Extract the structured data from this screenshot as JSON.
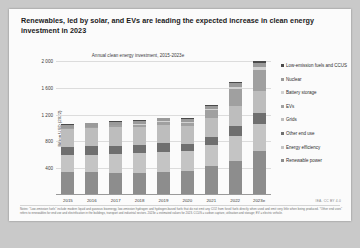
{
  "slide": {
    "title": "Renewables, led by solar, and EVs are leading the expected increase in clean energy investment in 2023",
    "credit": "IEA. CC BY 4.0",
    "notes": "Notes: \"Low-emission fuels\" include modern liquid and gaseous bioenergy, low-emission hydrogen and hydrogen-based fuels that do not emit any CO2 from fossil fuels directly when used and emit very little when being produced. \"Other end uses\" refers to renewables for end use and electrification in the buildings, transport and industrial sectors. 2023e = estimated values for 2023. CCUS = carbon capture, utilisation and storage; EV = electric vehicle.",
    "caption": ""
  },
  "chart_data": {
    "type": "bar",
    "title": "Annual clean energy investment, 2015-2023e",
    "xlabel": "",
    "ylabel": "Billion USD (2022)",
    "ylim": [
      0,
      2000
    ],
    "yticks": [
      "400",
      "800",
      "1 200",
      "1 600",
      "2 000"
    ],
    "grid": true,
    "legend_position": "right",
    "stacked": true,
    "categories": [
      "2015",
      "2016",
      "2017",
      "2018",
      "2019",
      "2020",
      "2021",
      "2022",
      "2023e"
    ],
    "series": [
      {
        "name": "Renewable power",
        "color": "#8d8d8d",
        "values": [
          350,
          340,
          335,
          330,
          345,
          360,
          430,
          510,
          660
        ]
      },
      {
        "name": "Energy efficiency",
        "color": "#c4c4c4",
        "values": [
          250,
          260,
          275,
          290,
          300,
          290,
          320,
          370,
          400
        ]
      },
      {
        "name": "Other end use",
        "color": "#6f6f6f",
        "values": [
          120,
          125,
          125,
          120,
          125,
          110,
          120,
          145,
          160
        ]
      },
      {
        "name": "Grids",
        "color": "#bdbdbd",
        "values": [
          270,
          275,
          280,
          275,
          275,
          265,
          285,
          305,
          330
        ]
      },
      {
        "name": "EVs",
        "color": "#a0a0a0",
        "values": [
          10,
          15,
          25,
          35,
          45,
          50,
          110,
          250,
          310
        ]
      },
      {
        "name": "Battery storage",
        "color": "#d2d2d2",
        "values": [
          5,
          6,
          8,
          10,
          12,
          15,
          22,
          35,
          55
        ]
      },
      {
        "name": "Nuclear",
        "color": "#9a9a9a",
        "values": [
          45,
          48,
          48,
          45,
          45,
          45,
          48,
          52,
          60
        ]
      },
      {
        "name": "Low-emission fuels and CCUS",
        "color": "#4a4a4a",
        "values": [
          8,
          8,
          8,
          8,
          9,
          9,
          12,
          18,
          28
        ]
      }
    ]
  },
  "legend": [
    {
      "label": "Low-emission fuels and CCUS",
      "color": "#4a4a4a"
    },
    {
      "label": "Nuclear",
      "color": "#9a9a9a"
    },
    {
      "label": "Battery storage",
      "color": "#d2d2d2"
    },
    {
      "label": "EVs",
      "color": "#a0a0a0"
    },
    {
      "label": "Grids",
      "color": "#bdbdbd"
    },
    {
      "label": "Other end use",
      "color": "#6f6f6f"
    },
    {
      "label": "Energy efficiency",
      "color": "#c4c4c4"
    },
    {
      "label": "Renewable power",
      "color": "#8d8d8d"
    }
  ]
}
